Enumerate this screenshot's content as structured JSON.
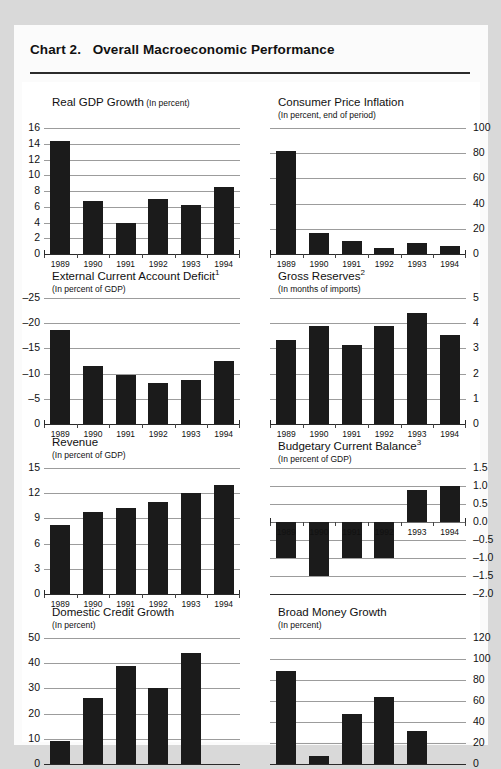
{
  "page": {
    "chart_label": "Chart 2.",
    "chart_title": "Overall Macroeconomic Performance",
    "background_color": "#d9d9d9",
    "card_color": "#ffffff",
    "bar_color": "#1b1b1b",
    "grid_color": "#9c9c9c"
  },
  "chart_data": [
    {
      "type": "bar",
      "id": "real-gdp-growth",
      "title": "Real GDP Growth",
      "unit": "(In percent)",
      "unit_inline": true,
      "footnote": "",
      "categories": [
        "1989",
        "1990",
        "1991",
        "1992",
        "1993",
        "1994"
      ],
      "values": [
        14.3,
        6.7,
        4.0,
        7.0,
        6.2,
        8.5
      ],
      "ylim": [
        0,
        16
      ],
      "yticks": [
        0,
        2,
        4,
        6,
        8,
        10,
        12,
        14,
        16
      ],
      "ytick_labels": [
        "0",
        "2",
        "4",
        "6",
        "8",
        "10",
        "12",
        "14",
        "16"
      ],
      "axis_side": "left",
      "grid": true,
      "xlabel": "",
      "ylabel": ""
    },
    {
      "type": "bar",
      "id": "consumer-price-inflation",
      "title": "Consumer Price Inflation",
      "unit": "(In percent, end of period)",
      "unit_inline": false,
      "footnote": "",
      "categories": [
        "1989",
        "1990",
        "1991",
        "1992",
        "1993",
        "1994"
      ],
      "values": [
        82,
        17,
        10,
        5,
        9,
        6.5
      ],
      "ylim": [
        0,
        100
      ],
      "yticks": [
        0,
        20,
        40,
        60,
        80,
        100
      ],
      "ytick_labels": [
        "0",
        "20",
        "40",
        "60",
        "80",
        "100"
      ],
      "axis_side": "right",
      "grid": true,
      "xlabel": "",
      "ylabel": ""
    },
    {
      "type": "bar",
      "id": "external-current-account-deficit",
      "title": "External Current Account Deficit",
      "unit": "(In percent of GDP)",
      "unit_inline": false,
      "footnote": "1",
      "categories": [
        "1989",
        "1990",
        "1991",
        "1992",
        "1993",
        "1994"
      ],
      "values": [
        -18.7,
        -11.5,
        -9.7,
        -8.1,
        -8.7,
        -12.5
      ],
      "ylim": [
        0,
        -25
      ],
      "yticks": [
        0,
        -5,
        -10,
        -15,
        -20,
        -25
      ],
      "ytick_labels": [
        "0",
        "–5",
        "–10",
        "–15",
        "–20",
        "–25"
      ],
      "axis_side": "left",
      "grid": true,
      "inverted": true,
      "xlabel": "",
      "ylabel": ""
    },
    {
      "type": "bar",
      "id": "gross-reserves",
      "title": "Gross Reserves",
      "unit": "(In months of imports)",
      "unit_inline": false,
      "footnote": "2",
      "categories": [
        "1989",
        "1990",
        "1991",
        "1992",
        "1993",
        "1994"
      ],
      "values": [
        3.35,
        3.9,
        3.15,
        3.9,
        4.4,
        3.55
      ],
      "ylim": [
        0,
        5
      ],
      "yticks": [
        0,
        1,
        2,
        3,
        4,
        5
      ],
      "ytick_labels": [
        "0",
        "1",
        "2",
        "3",
        "4",
        "5"
      ],
      "axis_side": "right",
      "grid": true,
      "xlabel": "",
      "ylabel": ""
    },
    {
      "type": "bar",
      "id": "revenue",
      "title": "Revenue",
      "unit": "(In percent of GDP)",
      "unit_inline": false,
      "footnote": "",
      "categories": [
        "1989",
        "1990",
        "1991",
        "1992",
        "1993",
        "1994"
      ],
      "values": [
        8.2,
        9.8,
        10.2,
        11.0,
        12.0,
        13.0
      ],
      "ylim": [
        0,
        15
      ],
      "yticks": [
        0,
        3,
        6,
        9,
        12,
        15
      ],
      "ytick_labels": [
        "0",
        "3",
        "6",
        "9",
        "12",
        "15"
      ],
      "axis_side": "left",
      "grid": true,
      "xlabel": "",
      "ylabel": ""
    },
    {
      "type": "bar",
      "id": "budgetary-current-balance",
      "title": "Budgetary Current Balance",
      "unit": "(In percent of GDP)",
      "unit_inline": false,
      "footnote": "3",
      "categories": [
        "1989",
        "1990",
        "1991",
        "1992",
        "1993",
        "1994"
      ],
      "values": [
        -1.0,
        -1.5,
        -1.0,
        -1.0,
        0.9,
        1.0
      ],
      "ylim": [
        -2.0,
        1.5
      ],
      "yticks": [
        -2.0,
        -1.5,
        -1.0,
        -0.5,
        0.0,
        0.5,
        1.0,
        1.5
      ],
      "ytick_labels": [
        "–2.0",
        "–1.5",
        "–1.0",
        "–0.5",
        "0.0",
        "0.5",
        "1.0",
        "1.5"
      ],
      "axis_side": "right",
      "grid": true,
      "zero_line": 0,
      "xlabel": "",
      "ylabel": ""
    },
    {
      "type": "bar",
      "id": "domestic-credit-growth",
      "title": "Domestic Credit Growth",
      "unit": "(In percent)",
      "unit_inline": false,
      "footnote": "",
      "categories": [
        "1989",
        "1990",
        "1991",
        "1992",
        "1993",
        "1994"
      ],
      "values": [
        9,
        26,
        39,
        30,
        44,
        null
      ],
      "ylim": [
        0,
        50
      ],
      "yticks": [
        0,
        10,
        20,
        30,
        40,
        50
      ],
      "ytick_labels": [
        "0",
        "10",
        "20",
        "30",
        "40",
        "50"
      ],
      "axis_side": "left",
      "grid": true,
      "clipped": true,
      "xlabel": "",
      "ylabel": ""
    },
    {
      "type": "bar",
      "id": "broad-money-growth",
      "title": "Broad Money Growth",
      "unit": "(In percent)",
      "unit_inline": false,
      "footnote": "",
      "categories": [
        "1989",
        "1990",
        "1991",
        "1992",
        "1993",
        "1994"
      ],
      "values": [
        89,
        8,
        48,
        64,
        31,
        null
      ],
      "ylim": [
        0,
        120
      ],
      "yticks": [
        0,
        20,
        40,
        60,
        80,
        100,
        120
      ],
      "ytick_labels": [
        "0",
        "20",
        "40",
        "60",
        "80",
        "100",
        "120"
      ],
      "axis_side": "right",
      "grid": true,
      "clipped": true,
      "xlabel": "",
      "ylabel": ""
    }
  ]
}
